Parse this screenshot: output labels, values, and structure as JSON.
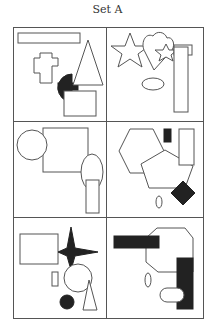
{
  "title": "Set A",
  "colors": {
    "stroke": "#555555",
    "fill_dark": "#222222",
    "background": "#ffffff"
  },
  "panels": [
    {
      "id": "panel-1",
      "position": "row1-left",
      "shapes": [
        "rectangle-outline",
        "cross-outline",
        "semicircle-filled",
        "triangle-outline",
        "rectangle-outline"
      ]
    },
    {
      "id": "panel-2",
      "position": "row1-right",
      "shapes": [
        "star-outline",
        "heart-outline",
        "small-star-outline",
        "tall-rectangle-outline",
        "small-rectangle-outline",
        "ellipse-outline"
      ]
    },
    {
      "id": "panel-3",
      "position": "row2-left",
      "shapes": [
        "circle-outline",
        "square-outline",
        "ellipse-outline",
        "rectangle-outline"
      ]
    },
    {
      "id": "panel-4",
      "position": "row2-right",
      "shapes": [
        "hexagon-outline",
        "pentagon-outline",
        "small-bar-filled",
        "rectangle-outline",
        "diamond-filled",
        "small-ellipse-outline"
      ]
    },
    {
      "id": "panel-5",
      "position": "row3-left",
      "shapes": [
        "rectangle-outline",
        "four-point-star-filled",
        "circle-outline",
        "small-rectangle-outline",
        "circle-filled",
        "triangle-outline"
      ]
    },
    {
      "id": "panel-6",
      "position": "row3-right",
      "shapes": [
        "horizontal-bar-filled",
        "octagon-outline",
        "vertical-bar-filled",
        "small-ellipse-outline",
        "rounded-rect-outline"
      ]
    }
  ]
}
